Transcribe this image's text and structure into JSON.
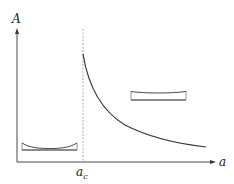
{
  "diagram": {
    "y_axis_label": "A",
    "x_axis_label": "a",
    "critical_label_base": "a",
    "critical_label_sub": "c",
    "curve_description": "A decreases monotonically for a > a_c, starting high at a_c and decaying toward the right",
    "insets": [
      {
        "position": "left",
        "description": "film with strongly curved (concave) upper surface on a flat substrate, below a_c"
      },
      {
        "position": "right",
        "description": "film with slightly curved upper surface on a flat substrate, for large a"
      }
    ],
    "colors": {
      "axis": "#333333",
      "curve": "#3a3a3a",
      "dashed": "#999999",
      "substrate": "#8c8c8c"
    }
  }
}
